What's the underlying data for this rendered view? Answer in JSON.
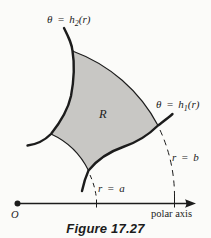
{
  "figure": {
    "caption": "Figure 17.27",
    "region_label": "R",
    "origin_label": "O",
    "axis_label": "polar axis",
    "labels": {
      "theta_h2": {
        "prefix": "θ = h",
        "sub": "2",
        "suffix": "(r)"
      },
      "theta_h1": {
        "prefix": "θ = h",
        "sub": "1",
        "suffix": "(r)"
      },
      "r_equals_a": "r = a",
      "r_equals_b": "r = b"
    },
    "colors": {
      "ink": "#1c1c1c",
      "region_fill": "#c8c7c4",
      "paper": "#fbfbf9"
    }
  }
}
